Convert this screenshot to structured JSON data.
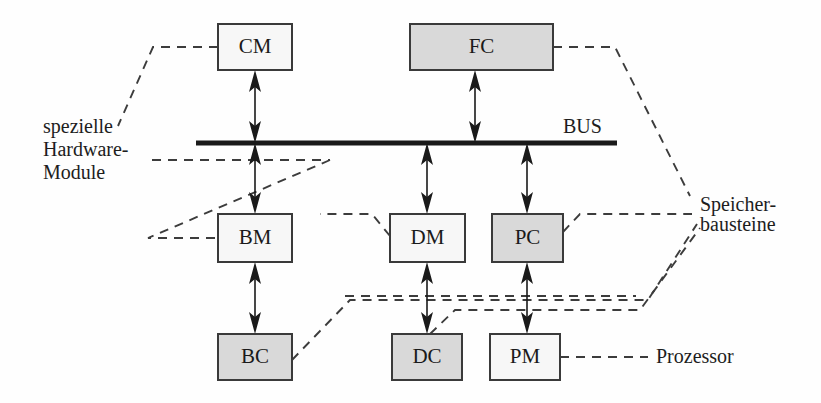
{
  "diagram": {
    "bus": {
      "label": "BUS",
      "color": "#1a1a1a"
    },
    "colors": {
      "box_plain_fill": "#f7f7f7",
      "box_shaded_fill": "#d9d9d9",
      "box_stroke": "#3a3a3a",
      "line": "#1a1a1a",
      "dashed": "#3c3c3c",
      "text": "#1a1a1a",
      "background": "#ffffff"
    },
    "boxes": [
      {
        "id": "cm",
        "label": "CM",
        "shaded": false,
        "x": 218,
        "y": 24,
        "w": 74,
        "h": 46,
        "row": "top"
      },
      {
        "id": "fc",
        "label": "FC",
        "shaded": true,
        "x": 410,
        "y": 24,
        "w": 143,
        "h": 46,
        "row": "top"
      },
      {
        "id": "bm",
        "label": "BM",
        "shaded": false,
        "x": 218,
        "y": 214,
        "w": 74,
        "h": 48,
        "row": "middle"
      },
      {
        "id": "dm",
        "label": "DM",
        "shaded": false,
        "x": 390,
        "y": 214,
        "w": 75,
        "h": 48,
        "row": "middle"
      },
      {
        "id": "pc",
        "label": "PC",
        "shaded": true,
        "x": 492,
        "y": 214,
        "w": 71,
        "h": 48,
        "row": "middle"
      },
      {
        "id": "bc",
        "label": "BC",
        "shaded": true,
        "x": 218,
        "y": 334,
        "w": 74,
        "h": 46,
        "row": "bottom"
      },
      {
        "id": "dc",
        "label": "DC",
        "shaded": true,
        "x": 392,
        "y": 334,
        "w": 70,
        "h": 46,
        "row": "bottom"
      },
      {
        "id": "pm",
        "label": "PM",
        "shaded": false,
        "x": 490,
        "y": 334,
        "w": 70,
        "h": 46,
        "row": "bottom"
      }
    ],
    "annotations": [
      {
        "id": "special-hardware",
        "lines": [
          "spezielle",
          "Hardware-",
          "Module"
        ],
        "x": 43,
        "y": 133,
        "line_height": 23,
        "align": "left"
      },
      {
        "id": "memory-modules",
        "lines": [
          "Speicher-",
          "bausteine"
        ],
        "x": 700,
        "y": 211,
        "line_height": 20,
        "align": "left"
      },
      {
        "id": "processor",
        "lines": [
          "Prozessor"
        ],
        "x": 656,
        "y": 363,
        "line_height": 20,
        "align": "left"
      }
    ],
    "bus_label_pos": {
      "x": 563,
      "y": 133
    }
  }
}
